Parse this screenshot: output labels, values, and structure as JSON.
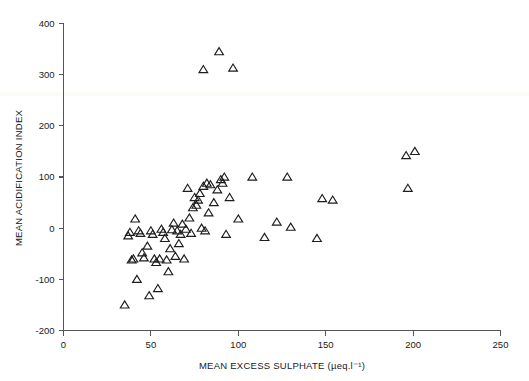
{
  "figure": {
    "background_color": "#ffffff",
    "marker_color": "#1d1d1d",
    "axis_color": "#555555",
    "marker_shape": "open-triangle-up",
    "marker_size_px": 7
  },
  "chart_data": {
    "type": "scatter",
    "title": "",
    "subtitle": "",
    "xlabel": "MEAN EXCESS SULPHATE (µeq.l⁻¹)",
    "ylabel": "MEAN ACIDIFICATION INDEX",
    "xlim": [
      0,
      250
    ],
    "ylim": [
      -200,
      400
    ],
    "xticks": [
      0,
      50,
      100,
      150,
      200,
      250
    ],
    "xtick_labels": [
      "0",
      "50",
      "100",
      "150",
      "200",
      "250"
    ],
    "yticks": [
      -200,
      -100,
      0,
      100,
      200,
      300,
      400
    ],
    "ytick_labels": [
      "-200",
      "-100",
      "0",
      "100",
      "200",
      "300",
      "400"
    ],
    "grid": false,
    "legend": null,
    "legend_position": "none",
    "annotations": [],
    "series": [
      {
        "name": "Sites",
        "marker": "triangle-up-open",
        "points": [
          [
            35,
            -150
          ],
          [
            37,
            -15
          ],
          [
            38,
            -8
          ],
          [
            39,
            -62
          ],
          [
            40,
            -60
          ],
          [
            41,
            18
          ],
          [
            42,
            -100
          ],
          [
            43,
            -5
          ],
          [
            44,
            -10
          ],
          [
            45,
            -48
          ],
          [
            46,
            -58
          ],
          [
            48,
            -35
          ],
          [
            49,
            -132
          ],
          [
            50,
            -5
          ],
          [
            51,
            -12
          ],
          [
            52,
            -60
          ],
          [
            53,
            -67
          ],
          [
            54,
            -118
          ],
          [
            55,
            -60
          ],
          [
            56,
            -2
          ],
          [
            57,
            -8
          ],
          [
            58,
            -20
          ],
          [
            59,
            -62
          ],
          [
            60,
            -85
          ],
          [
            61,
            -40
          ],
          [
            62,
            -3
          ],
          [
            63,
            10
          ],
          [
            64,
            -55
          ],
          [
            65,
            -5
          ],
          [
            66,
            -30
          ],
          [
            67,
            -12
          ],
          [
            68,
            8
          ],
          [
            69,
            -60
          ],
          [
            70,
            -2
          ],
          [
            71,
            78
          ],
          [
            72,
            20
          ],
          [
            73,
            -10
          ],
          [
            74,
            40
          ],
          [
            75,
            60
          ],
          [
            76,
            45
          ],
          [
            77,
            55
          ],
          [
            78,
            68
          ],
          [
            79,
            0
          ],
          [
            80,
            82
          ],
          [
            80,
            310
          ],
          [
            81,
            -5
          ],
          [
            82,
            88
          ],
          [
            83,
            30
          ],
          [
            84,
            85
          ],
          [
            86,
            50
          ],
          [
            88,
            75
          ],
          [
            89,
            345
          ],
          [
            90,
            95
          ],
          [
            91,
            88
          ],
          [
            92,
            100
          ],
          [
            93,
            -12
          ],
          [
            95,
            60
          ],
          [
            97,
            313
          ],
          [
            100,
            18
          ],
          [
            108,
            100
          ],
          [
            115,
            -18
          ],
          [
            122,
            12
          ],
          [
            128,
            100
          ],
          [
            130,
            2
          ],
          [
            145,
            -20
          ],
          [
            148,
            58
          ],
          [
            154,
            55
          ],
          [
            196,
            142
          ],
          [
            197,
            78
          ],
          [
            201,
            150
          ]
        ]
      }
    ]
  }
}
